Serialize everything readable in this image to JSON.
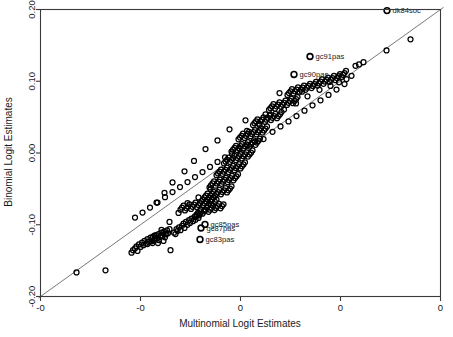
{
  "chart_data": {
    "type": "scatter",
    "title": "",
    "xlabel": "Multinomial Logit Estimates",
    "ylabel": "Binomial Logit Estimates",
    "xlim": [
      -0.2,
      0.2
    ],
    "ylim": [
      -0.2,
      0.2
    ],
    "grid": false,
    "legend": "none",
    "xticks": [
      -0.2,
      -0.1,
      0.0,
      0.1,
      0.2
    ],
    "yticks": [
      -0.2,
      -0.1,
      0.0,
      0.1,
      0.2
    ],
    "xticklabels": [
      "-0",
      "-0",
      "0",
      "0",
      "0"
    ],
    "yticklabels": [
      "-0.20",
      "-0.10",
      "0.00",
      "0.10",
      "0.20"
    ],
    "reference_line": {
      "type": "identity",
      "slope": 1,
      "intercept": 0,
      "from": [
        -0.202,
        -0.202
      ],
      "to": [
        0.203,
        0.203
      ]
    },
    "marker": "open-circle",
    "annotations": [
      {
        "label": "dk84soc",
        "x": 0.1465,
        "y": 0.1985
      },
      {
        "label": "gc91pas",
        "x": 0.0695,
        "y": 0.1345
      },
      {
        "label": "gc90pas",
        "x": 0.0535,
        "y": 0.1095
      },
      {
        "label": "gc85pas",
        "x": -0.0355,
        "y": -0.0995
      },
      {
        "label": "gc87pas",
        "x": -0.0395,
        "y": -0.1045
      },
      {
        "label": "gc83pas",
        "x": -0.0405,
        "y": -0.1205
      }
    ],
    "points": [
      [
        -0.164,
        -0.1665
      ],
      [
        -0.135,
        -0.1635
      ],
      [
        -0.109,
        -0.139
      ],
      [
        -0.1075,
        -0.1355
      ],
      [
        -0.1055,
        -0.133
      ],
      [
        -0.104,
        -0.13
      ],
      [
        -0.103,
        -0.1365
      ],
      [
        -0.1015,
        -0.1275
      ],
      [
        -0.1,
        -0.131
      ],
      [
        -0.0985,
        -0.125
      ],
      [
        -0.097,
        -0.1285
      ],
      [
        -0.096,
        -0.1225
      ],
      [
        -0.0945,
        -0.1265
      ],
      [
        -0.093,
        -0.12
      ],
      [
        -0.0915,
        -0.124
      ],
      [
        -0.09,
        -0.118
      ],
      [
        -0.089,
        -0.123
      ],
      [
        -0.0875,
        -0.1165
      ],
      [
        -0.086,
        -0.1205
      ],
      [
        -0.0845,
        -0.1145
      ],
      [
        -0.0835,
        -0.119
      ],
      [
        -0.082,
        -0.113
      ],
      [
        -0.0805,
        -0.117
      ],
      [
        -0.079,
        -0.111
      ],
      [
        -0.078,
        -0.1155
      ],
      [
        -0.0765,
        -0.1095
      ],
      [
        -0.075,
        -0.1135
      ],
      [
        -0.0735,
        -0.108
      ],
      [
        -0.0725,
        -0.112
      ],
      [
        -0.071,
        -0.106
      ],
      [
        -0.088,
        -0.1255
      ],
      [
        -0.0865,
        -0.122
      ],
      [
        -0.085,
        -0.1185
      ],
      [
        -0.0825,
        -0.1255
      ],
      [
        -0.0815,
        -0.1215
      ],
      [
        -0.0795,
        -0.1155
      ],
      [
        -0.077,
        -0.1225
      ],
      [
        -0.0755,
        -0.1175
      ],
      [
        -0.074,
        -0.1125
      ],
      [
        -0.07,
        -0.1355
      ],
      [
        -0.0665,
        -0.111
      ],
      [
        -0.064,
        -0.106
      ],
      [
        -0.065,
        -0.113
      ],
      [
        -0.063,
        -0.1085
      ],
      [
        -0.0615,
        -0.1035
      ],
      [
        -0.06,
        -0.1075
      ],
      [
        -0.0585,
        -0.1015
      ],
      [
        -0.057,
        -0.0985
      ],
      [
        -0.056,
        -0.1045
      ],
      [
        -0.0545,
        -0.096
      ],
      [
        -0.053,
        -0.1
      ],
      [
        -0.0515,
        -0.0935
      ],
      [
        -0.0505,
        -0.0975
      ],
      [
        -0.049,
        -0.0915
      ],
      [
        -0.0475,
        -0.095
      ],
      [
        -0.046,
        -0.089
      ],
      [
        -0.045,
        -0.093
      ],
      [
        -0.0435,
        -0.087
      ],
      [
        -0.042,
        -0.0905
      ],
      [
        -0.0405,
        -0.085
      ],
      [
        -0.06,
        -0.079
      ],
      [
        -0.0585,
        -0.076
      ],
      [
        -0.057,
        -0.0735
      ],
      [
        -0.0555,
        -0.08
      ],
      [
        -0.054,
        -0.077
      ],
      [
        -0.0525,
        -0.0745
      ],
      [
        -0.051,
        -0.0715
      ],
      [
        -0.0495,
        -0.078
      ],
      [
        -0.048,
        -0.075
      ],
      [
        -0.0465,
        -0.072
      ],
      [
        -0.045,
        -0.069
      ],
      [
        -0.0435,
        -0.0755
      ],
      [
        -0.042,
        -0.0725
      ],
      [
        -0.0405,
        -0.07
      ],
      [
        -0.039,
        -0.067
      ],
      [
        -0.0375,
        -0.073
      ],
      [
        -0.036,
        -0.07
      ],
      [
        -0.0345,
        -0.0675
      ],
      [
        -0.033,
        -0.0645
      ],
      [
        -0.0315,
        -0.0705
      ],
      [
        -0.03,
        -0.0675
      ],
      [
        -0.0285,
        -0.065
      ],
      [
        -0.027,
        -0.062
      ],
      [
        -0.0255,
        -0.068
      ],
      [
        -0.0455,
        -0.0885
      ],
      [
        -0.044,
        -0.086
      ],
      [
        -0.0425,
        -0.0835
      ],
      [
        -0.041,
        -0.081
      ],
      [
        -0.0395,
        -0.0785
      ],
      [
        -0.038,
        -0.0845
      ],
      [
        -0.0365,
        -0.0815
      ],
      [
        -0.035,
        -0.079
      ],
      [
        -0.0335,
        -0.076
      ],
      [
        -0.032,
        -0.082
      ],
      [
        -0.0305,
        -0.079
      ],
      [
        -0.029,
        -0.0765
      ],
      [
        -0.0275,
        -0.0735
      ],
      [
        -0.026,
        -0.0795
      ],
      [
        -0.0245,
        -0.0765
      ],
      [
        -0.023,
        -0.074
      ],
      [
        -0.0215,
        -0.071
      ],
      [
        -0.02,
        -0.077
      ],
      [
        -0.0185,
        -0.074
      ],
      [
        -0.017,
        -0.0715
      ],
      [
        -0.0375,
        -0.065
      ],
      [
        -0.036,
        -0.062
      ],
      [
        -0.0345,
        -0.0595
      ],
      [
        -0.033,
        -0.0565
      ],
      [
        -0.0315,
        -0.0625
      ],
      [
        -0.03,
        -0.0595
      ],
      [
        -0.0285,
        -0.057
      ],
      [
        -0.027,
        -0.054
      ],
      [
        -0.0255,
        -0.06
      ],
      [
        -0.024,
        -0.057
      ],
      [
        -0.0225,
        -0.0545
      ],
      [
        -0.021,
        -0.0515
      ],
      [
        -0.0195,
        -0.0575
      ],
      [
        -0.018,
        -0.0545
      ],
      [
        -0.0165,
        -0.052
      ],
      [
        -0.015,
        -0.049
      ],
      [
        -0.0135,
        -0.055
      ],
      [
        -0.012,
        -0.052
      ],
      [
        -0.0105,
        -0.0495
      ],
      [
        -0.009,
        -0.0465
      ],
      [
        -0.031,
        -0.048
      ],
      [
        -0.0295,
        -0.045
      ],
      [
        -0.028,
        -0.0425
      ],
      [
        -0.0265,
        -0.0395
      ],
      [
        -0.025,
        -0.0455
      ],
      [
        -0.0235,
        -0.0425
      ],
      [
        -0.022,
        -0.04
      ],
      [
        -0.0205,
        -0.037
      ],
      [
        -0.019,
        -0.043
      ],
      [
        -0.0175,
        -0.04
      ],
      [
        -0.016,
        -0.0375
      ],
      [
        -0.0145,
        -0.0345
      ],
      [
        -0.013,
        -0.0405
      ],
      [
        -0.0115,
        -0.0375
      ],
      [
        -0.01,
        -0.035
      ],
      [
        -0.0085,
        -0.032
      ],
      [
        -0.007,
        -0.038
      ],
      [
        -0.0055,
        -0.035
      ],
      [
        -0.004,
        -0.0325
      ],
      [
        -0.0025,
        -0.0295
      ],
      [
        -0.024,
        -0.031
      ],
      [
        -0.0225,
        -0.0285
      ],
      [
        -0.021,
        -0.026
      ],
      [
        -0.0195,
        -0.023
      ],
      [
        -0.018,
        -0.029
      ],
      [
        -0.0165,
        -0.026
      ],
      [
        -0.015,
        -0.0235
      ],
      [
        -0.0135,
        -0.0205
      ],
      [
        -0.012,
        -0.0265
      ],
      [
        -0.0105,
        -0.0235
      ],
      [
        -0.009,
        -0.021
      ],
      [
        -0.0075,
        -0.018
      ],
      [
        -0.006,
        -0.024
      ],
      [
        -0.0045,
        -0.021
      ],
      [
        -0.003,
        -0.0185
      ],
      [
        -0.0015,
        -0.0155
      ],
      [
        0.0,
        -0.0215
      ],
      [
        0.0015,
        -0.0185
      ],
      [
        0.003,
        -0.016
      ],
      [
        0.0045,
        -0.013
      ],
      [
        -0.0165,
        -0.0145
      ],
      [
        -0.015,
        -0.012
      ],
      [
        -0.0135,
        -0.0095
      ],
      [
        -0.012,
        -0.0065
      ],
      [
        -0.0105,
        -0.0125
      ],
      [
        -0.009,
        -0.0095
      ],
      [
        -0.0075,
        -0.007
      ],
      [
        -0.006,
        -0.004
      ],
      [
        -0.0045,
        -0.01
      ],
      [
        -0.003,
        -0.007
      ],
      [
        -0.0015,
        -0.0045
      ],
      [
        0.0,
        -0.0015
      ],
      [
        0.0015,
        -0.0075
      ],
      [
        0.003,
        -0.0045
      ],
      [
        0.0045,
        -0.002
      ],
      [
        0.006,
        0.001
      ],
      [
        0.0075,
        -0.005
      ],
      [
        0.009,
        -0.002
      ],
      [
        0.0105,
        0.0005
      ],
      [
        0.012,
        0.0035
      ],
      [
        -0.009,
        0.002
      ],
      [
        -0.0075,
        0.0045
      ],
      [
        -0.006,
        0.007
      ],
      [
        -0.0045,
        0.01
      ],
      [
        -0.003,
        0.004
      ],
      [
        -0.0015,
        0.007
      ],
      [
        0.0,
        0.0095
      ],
      [
        0.0015,
        0.0125
      ],
      [
        0.003,
        0.0065
      ],
      [
        0.0045,
        0.0095
      ],
      [
        0.006,
        0.012
      ],
      [
        0.0075,
        0.015
      ],
      [
        0.009,
        0.009
      ],
      [
        0.0105,
        0.012
      ],
      [
        0.012,
        0.0145
      ],
      [
        0.0135,
        0.0175
      ],
      [
        0.015,
        0.0115
      ],
      [
        0.0165,
        0.0145
      ],
      [
        0.018,
        0.017
      ],
      [
        0.0195,
        0.02
      ],
      [
        -0.002,
        0.019
      ],
      [
        -0.0005,
        0.0215
      ],
      [
        0.001,
        0.024
      ],
      [
        0.0025,
        0.027
      ],
      [
        0.004,
        0.021
      ],
      [
        0.0055,
        0.024
      ],
      [
        0.007,
        0.0265
      ],
      [
        0.0085,
        0.0295
      ],
      [
        0.01,
        0.0235
      ],
      [
        0.0115,
        0.0265
      ],
      [
        0.013,
        0.029
      ],
      [
        0.0145,
        0.032
      ],
      [
        0.016,
        0.026
      ],
      [
        0.0175,
        0.029
      ],
      [
        0.019,
        0.0315
      ],
      [
        0.0205,
        0.0345
      ],
      [
        0.022,
        0.0285
      ],
      [
        0.0235,
        0.0315
      ],
      [
        0.025,
        0.034
      ],
      [
        0.0265,
        0.037
      ],
      [
        0.0125,
        0.039
      ],
      [
        0.014,
        0.0415
      ],
      [
        0.0155,
        0.044
      ],
      [
        0.017,
        0.047
      ],
      [
        0.0185,
        0.041
      ],
      [
        0.02,
        0.044
      ],
      [
        0.0215,
        0.0465
      ],
      [
        0.023,
        0.0495
      ],
      [
        0.0245,
        0.0435
      ],
      [
        0.026,
        0.0465
      ],
      [
        0.0275,
        0.049
      ],
      [
        0.029,
        0.052
      ],
      [
        0.0305,
        0.046
      ],
      [
        0.032,
        0.049
      ],
      [
        0.0335,
        0.0515
      ],
      [
        0.035,
        0.0545
      ],
      [
        0.0365,
        0.0485
      ],
      [
        0.038,
        0.0515
      ],
      [
        0.0395,
        0.054
      ],
      [
        0.041,
        0.057
      ],
      [
        0.0285,
        0.06
      ],
      [
        0.03,
        0.0625
      ],
      [
        0.0315,
        0.065
      ],
      [
        0.033,
        0.068
      ],
      [
        0.0345,
        0.062
      ],
      [
        0.036,
        0.065
      ],
      [
        0.0375,
        0.0675
      ],
      [
        0.039,
        0.0705
      ],
      [
        0.0405,
        0.0645
      ],
      [
        0.042,
        0.0675
      ],
      [
        0.0435,
        0.07
      ],
      [
        0.045,
        0.073
      ],
      [
        0.0465,
        0.067
      ],
      [
        0.048,
        0.07
      ],
      [
        0.0495,
        0.0725
      ],
      [
        0.051,
        0.0755
      ],
      [
        0.0525,
        0.0695
      ],
      [
        0.054,
        0.0725
      ],
      [
        0.0555,
        0.075
      ],
      [
        0.057,
        0.078
      ],
      [
        0.047,
        0.081
      ],
      [
        0.0485,
        0.0835
      ],
      [
        0.05,
        0.086
      ],
      [
        0.0515,
        0.089
      ],
      [
        0.053,
        0.083
      ],
      [
        0.0545,
        0.086
      ],
      [
        0.056,
        0.0885
      ],
      [
        0.0575,
        0.0915
      ],
      [
        0.059,
        0.0855
      ],
      [
        0.0605,
        0.0885
      ],
      [
        0.062,
        0.091
      ],
      [
        0.0635,
        0.094
      ],
      [
        0.065,
        0.088
      ],
      [
        0.0665,
        0.091
      ],
      [
        0.068,
        0.0935
      ],
      [
        0.0695,
        0.0965
      ],
      [
        0.071,
        0.0905
      ],
      [
        0.0725,
        0.0935
      ],
      [
        0.074,
        0.096
      ],
      [
        0.0755,
        0.099
      ],
      [
        0.077,
        0.094
      ],
      [
        0.0785,
        0.097
      ],
      [
        0.08,
        0.0995
      ],
      [
        0.0815,
        0.1025
      ],
      [
        0.083,
        0.0965
      ],
      [
        0.0845,
        0.0995
      ],
      [
        0.086,
        0.102
      ],
      [
        0.0875,
        0.105
      ],
      [
        0.089,
        0.099
      ],
      [
        0.0905,
        0.102
      ],
      [
        0.092,
        0.1045
      ],
      [
        0.0935,
        0.1075
      ],
      [
        0.095,
        0.1015
      ],
      [
        0.0965,
        0.1045
      ],
      [
        0.098,
        0.107
      ],
      [
        0.0995,
        0.11
      ],
      [
        0.101,
        0.106
      ],
      [
        0.1025,
        0.109
      ],
      [
        0.104,
        0.1115
      ],
      [
        0.1055,
        0.1145
      ],
      [
        0.115,
        0.1215
      ],
      [
        0.1185,
        0.1235
      ],
      [
        0.123,
        0.1265
      ],
      [
        0.146,
        0.143
      ],
      [
        0.17,
        0.1585
      ],
      [
        0.0615,
        0.0855
      ],
      [
        0.039,
        0.0835
      ],
      [
        0.025,
        0.054
      ],
      [
        0.005,
        0.0455
      ],
      [
        -0.011,
        0.033
      ],
      [
        -0.023,
        0.0175
      ],
      [
        -0.035,
        0.0055
      ],
      [
        -0.0465,
        -0.011
      ],
      [
        -0.056,
        -0.0255
      ],
      [
        -0.068,
        -0.041
      ],
      [
        -0.076,
        -0.0555
      ],
      [
        -0.084,
        -0.069
      ],
      [
        0.0065,
        0.031
      ],
      [
        0.019,
        0.039
      ],
      [
        0.03,
        0.053
      ],
      [
        0.0435,
        0.0605
      ],
      [
        0.0555,
        0.069
      ],
      [
        0.067,
        0.079
      ],
      [
        0.079,
        0.088
      ],
      [
        0.09,
        0.0935
      ],
      [
        0.0985,
        0.0985
      ],
      [
        0.106,
        0.103
      ],
      [
        0.111,
        0.1075
      ],
      [
        -0.03,
        -0.0505
      ],
      [
        -0.042,
        -0.062
      ],
      [
        -0.053,
        -0.07
      ],
      [
        -0.062,
        -0.0835
      ],
      [
        -0.071,
        -0.096
      ],
      [
        -0.079,
        -0.107
      ],
      [
        -0.086,
        -0.115
      ],
      [
        -0.093,
        -0.127
      ],
      [
        -0.0415,
        -0.087
      ],
      [
        -0.0355,
        -0.08
      ],
      [
        -0.0295,
        -0.072
      ],
      [
        -0.024,
        -0.065
      ],
      [
        0.023,
        0.0195
      ],
      [
        0.0145,
        0.016
      ],
      [
        0.007,
        0.0105
      ],
      [
        -0.001,
        0.0055
      ],
      [
        -0.0085,
        -0.001
      ],
      [
        -0.0155,
        -0.006
      ],
      [
        -0.023,
        -0.0125
      ],
      [
        -0.0305,
        -0.0195
      ],
      [
        -0.038,
        -0.0265
      ],
      [
        -0.0455,
        -0.0335
      ],
      [
        0.032,
        0.0295
      ],
      [
        0.04,
        0.037
      ],
      [
        0.048,
        0.044
      ],
      [
        0.056,
        0.0515
      ],
      [
        0.064,
        0.059
      ],
      [
        0.072,
        0.0665
      ],
      [
        0.08,
        0.0735
      ],
      [
        0.088,
        0.081
      ],
      [
        0.096,
        0.0885
      ],
      [
        0.104,
        0.096
      ],
      [
        -0.053,
        -0.0405
      ],
      [
        -0.0605,
        -0.0475
      ],
      [
        -0.068,
        -0.0545
      ],
      [
        -0.0755,
        -0.0615
      ],
      [
        -0.083,
        -0.069
      ],
      [
        -0.0905,
        -0.076
      ],
      [
        -0.098,
        -0.083
      ],
      [
        -0.1055,
        -0.09
      ]
    ]
  },
  "figure": {
    "xlabel": "Multinomial Logit Estimates",
    "ylabel": "Binomial Logit Estimates"
  }
}
